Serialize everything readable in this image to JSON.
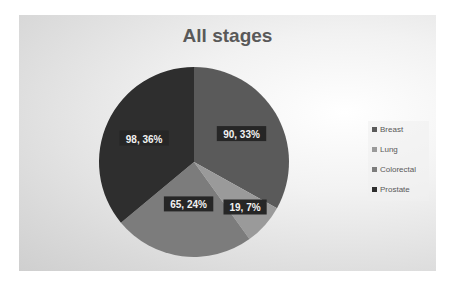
{
  "chart_data": {
    "type": "pie",
    "title": "All stages",
    "categories": [
      "Breast",
      "Lung",
      "Colorectal",
      "Prostate"
    ],
    "values": [
      90,
      19,
      65,
      98
    ],
    "percentages": [
      33,
      7,
      24,
      36
    ],
    "labels": [
      "90, 33%",
      "19, 7%",
      "65, 24%",
      "98, 36%"
    ],
    "colors": [
      "#5a5a5a",
      "#9a9a9a",
      "#7c7c7c",
      "#2e2e2e"
    ],
    "legend_position": "right",
    "start_angle": 0
  },
  "legend": {
    "items": [
      {
        "label": "Breast",
        "color": "#5a5a5a"
      },
      {
        "label": "Lung",
        "color": "#9a9a9a"
      },
      {
        "label": "Colorectal",
        "color": "#7c7c7c"
      },
      {
        "label": "Prostate",
        "color": "#2e2e2e"
      }
    ]
  }
}
